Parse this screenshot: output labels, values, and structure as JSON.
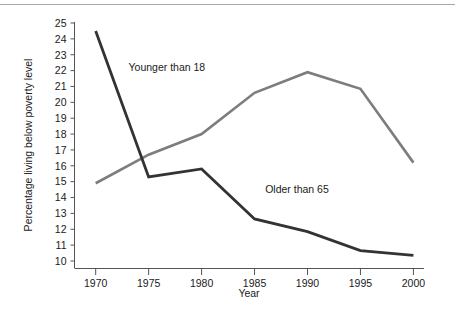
{
  "chart_data": {
    "type": "line",
    "title": "",
    "xlabel": "Year",
    "ylabel": "Percentage living below poverty level",
    "x": [
      1970,
      1975,
      1980,
      1985,
      1990,
      1995,
      2000
    ],
    "xtick_labels": [
      "1970",
      "1975",
      "1980",
      "1985",
      "1990",
      "1995",
      "2000"
    ],
    "xlim": [
      1968,
      2001
    ],
    "ylim": [
      9.2,
      25
    ],
    "ytick_labels": [
      "10",
      "11",
      "12",
      "13",
      "14",
      "15",
      "16",
      "17",
      "18",
      "19",
      "20",
      "21",
      "22",
      "23",
      "24",
      "25"
    ],
    "yticks": [
      10,
      11,
      12,
      13,
      14,
      15,
      16,
      17,
      18,
      19,
      20,
      21,
      22,
      23,
      24,
      25
    ],
    "grid": false,
    "legend_position": "inline-annotations",
    "series": [
      {
        "name": "Younger than 18",
        "color": "#7d7d7d",
        "line_width": 2.6,
        "values": [
          14.9,
          16.7,
          18.0,
          20.6,
          21.9,
          20.85,
          16.2
        ],
        "annotation": {
          "text": "Younger than 18",
          "x": 1973.1,
          "y": 22.0
        }
      },
      {
        "name": "Older than 65",
        "color": "#333333",
        "line_width": 2.8,
        "values": [
          24.5,
          15.3,
          15.8,
          12.65,
          11.85,
          10.65,
          10.35
        ],
        "annotation": {
          "text": "Older than 65",
          "x": 1986.0,
          "y": 14.3
        }
      }
    ]
  },
  "figure": {
    "background_color": "#ffffff",
    "axis_color": "#555555",
    "text_color": "#1a1a1a",
    "top_rule_color": "#a8a8a8"
  }
}
